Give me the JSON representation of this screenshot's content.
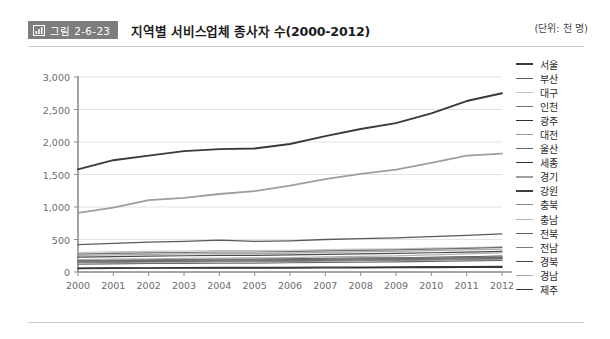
{
  "header": {
    "badge_label": "그림 2-6-23",
    "badge_icon": "bar-chart-icon",
    "badge_color": "#7d7d7d",
    "title": "지역별 서비스업체 종사자 수(2000-2012)",
    "unit_note": "(단위: 천 명)"
  },
  "chart_data": {
    "type": "line",
    "title": "지역별 서비스업체 종사자 수(2000-2012)",
    "subtitle": "(단위: 천 명)",
    "xlabel": "",
    "ylabel": "",
    "x": [
      2000,
      2001,
      2002,
      2003,
      2004,
      2005,
      2006,
      2007,
      2008,
      2009,
      2010,
      2011,
      2012
    ],
    "categories": [
      "2000",
      "2001",
      "2002",
      "2003",
      "2004",
      "2005",
      "2006",
      "2007",
      "2008",
      "2009",
      "2010",
      "2011",
      "2012"
    ],
    "xtick_labels": [
      "2000",
      "2001",
      "2002",
      "2003",
      "2004",
      "2005",
      "2006",
      "2007",
      "2008",
      "2009",
      "2010",
      "2011",
      "2012"
    ],
    "ytick_labels": [
      "0",
      "500",
      "1,000",
      "1,500",
      "2,000",
      "2,500",
      "3,000"
    ],
    "yticks": [
      0,
      500,
      1000,
      1500,
      2000,
      2500,
      3000
    ],
    "ylim": [
      0,
      3000
    ],
    "xlim": [
      2000,
      2012
    ],
    "grid": true,
    "grid_axis": "y",
    "legend_position": "right",
    "series": [
      {
        "name": "서울",
        "color": "#3a3a3a",
        "width": 1.9,
        "values": [
          1580,
          1720,
          1790,
          1860,
          1890,
          1900,
          1970,
          2090,
          2200,
          2290,
          2440,
          2630,
          2750
        ]
      },
      {
        "name": "부산",
        "color": "#5a5a5a",
        "width": 1.3,
        "values": [
          420,
          440,
          460,
          470,
          490,
          470,
          480,
          500,
          515,
          525,
          545,
          565,
          585
        ]
      },
      {
        "name": "대구",
        "color": "#c3c3c3",
        "width": 1.1,
        "values": [
          300,
          310,
          318,
          322,
          330,
          330,
          335,
          345,
          352,
          358,
          368,
          378,
          388
        ]
      },
      {
        "name": "인천",
        "color": "#6f6f6f",
        "width": 1.2,
        "values": [
          275,
          285,
          295,
          300,
          308,
          308,
          315,
          325,
          332,
          340,
          352,
          365,
          378
        ]
      },
      {
        "name": "광주",
        "color": "#2e2e2e",
        "width": 1.3,
        "values": [
          175,
          182,
          188,
          192,
          196,
          196,
          200,
          208,
          214,
          218,
          226,
          234,
          242
        ]
      },
      {
        "name": "대전",
        "color": "#9a9a9a",
        "width": 1.1,
        "values": [
          170,
          177,
          183,
          187,
          191,
          191,
          196,
          203,
          209,
          213,
          220,
          228,
          236
        ]
      },
      {
        "name": "울산",
        "color": "#6a6a6a",
        "width": 1.2,
        "values": [
          120,
          126,
          131,
          134,
          138,
          138,
          142,
          148,
          153,
          157,
          163,
          170,
          177
        ]
      },
      {
        "name": "세종",
        "color": "#343434",
        "width": 1.4,
        "values": [
          55,
          57,
          59,
          60,
          61,
          61,
          62,
          64,
          66,
          67,
          69,
          71,
          74
        ]
      },
      {
        "name": "경기",
        "color": "#9e9e9e",
        "width": 1.8,
        "values": [
          910,
          990,
          1105,
          1140,
          1200,
          1245,
          1330,
          1430,
          1510,
          1575,
          1680,
          1790,
          1820
        ]
      },
      {
        "name": "강원",
        "color": "#3f3f3f",
        "width": 1.5,
        "values": [
          150,
          155,
          160,
          163,
          167,
          167,
          171,
          177,
          182,
          186,
          192,
          199,
          206
        ]
      },
      {
        "name": "충북",
        "color": "#8a8a8a",
        "width": 1.1,
        "values": [
          145,
          150,
          155,
          158,
          162,
          162,
          166,
          172,
          177,
          181,
          187,
          194,
          201
        ]
      },
      {
        "name": "충남",
        "color": "#b0b0b0",
        "width": 1.2,
        "values": [
          190,
          197,
          204,
          209,
          214,
          216,
          222,
          232,
          240,
          248,
          262,
          278,
          295
        ]
      },
      {
        "name": "전북",
        "color": "#5f5f5f",
        "width": 1.2,
        "values": [
          165,
          171,
          176,
          180,
          184,
          184,
          188,
          195,
          200,
          204,
          211,
          219,
          226
        ]
      },
      {
        "name": "전남",
        "color": "#7b7b7b",
        "width": 1.1,
        "values": [
          160,
          165,
          170,
          173,
          177,
          177,
          181,
          187,
          192,
          196,
          202,
          209,
          216
        ]
      },
      {
        "name": "경북",
        "color": "#4a4a4a",
        "width": 1.2,
        "values": [
          230,
          238,
          245,
          250,
          256,
          256,
          262,
          272,
          280,
          286,
          296,
          307,
          318
        ]
      },
      {
        "name": "경남",
        "color": "#a8a8a8",
        "width": 1.2,
        "values": [
          255,
          264,
          272,
          278,
          284,
          284,
          291,
          302,
          311,
          318,
          329,
          341,
          353
        ]
      },
      {
        "name": "제주",
        "color": "#383838",
        "width": 1.3,
        "values": [
          60,
          63,
          65,
          67,
          69,
          69,
          71,
          74,
          76,
          78,
          81,
          84,
          88
        ]
      }
    ]
  }
}
